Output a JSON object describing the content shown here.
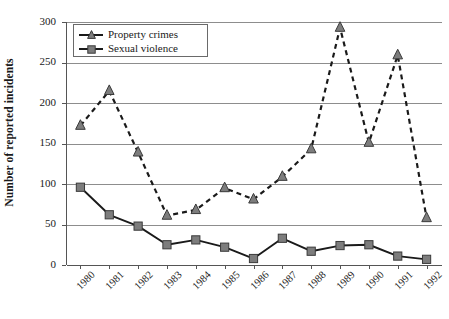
{
  "chart_data": {
    "type": "line",
    "title": "",
    "xlabel": "",
    "ylabel": "Number of reported incidents",
    "categories": [
      "1980",
      "1981",
      "1982",
      "1983",
      "1984",
      "1985",
      "1986",
      "1987",
      "1988",
      "1989",
      "1990",
      "1991",
      "1992"
    ],
    "ylim": [
      0,
      300
    ],
    "yticks": [
      0,
      50,
      100,
      150,
      200,
      250,
      300
    ],
    "ytick_labels": [
      "0",
      "50",
      "100",
      "150",
      "200",
      "250",
      "300"
    ],
    "grid": "horizontal",
    "legend_position": "top-left",
    "series": [
      {
        "name": "Property crimes",
        "marker": "triangle",
        "linestyle": "dashed",
        "color": "#7d7d7d",
        "line_color": "#1a1a1a",
        "values": [
          172,
          215,
          139,
          61,
          68,
          95,
          81,
          109,
          143,
          293,
          151,
          259,
          58
        ]
      },
      {
        "name": "Sexual violence",
        "marker": "square",
        "linestyle": "solid",
        "color": "#7d7d7d",
        "line_color": "#1a1a1a",
        "values": [
          96,
          62,
          48,
          25,
          31,
          22,
          8,
          33,
          17,
          24,
          25,
          11,
          7
        ]
      }
    ]
  },
  "legend": {
    "items": [
      {
        "label": "Property crimes",
        "marker": "triangle-marker-icon"
      },
      {
        "label": "Sexual violence",
        "marker": "square-marker-icon"
      }
    ]
  },
  "colors": {
    "marker_fill": "#7d7d7d",
    "marker_stroke": "#3a3a3a",
    "line": "#1a1a1a",
    "gridline": "#8d8d8d",
    "axis": "#555555",
    "background": "#ffffff",
    "text": "#1a1a1a"
  }
}
